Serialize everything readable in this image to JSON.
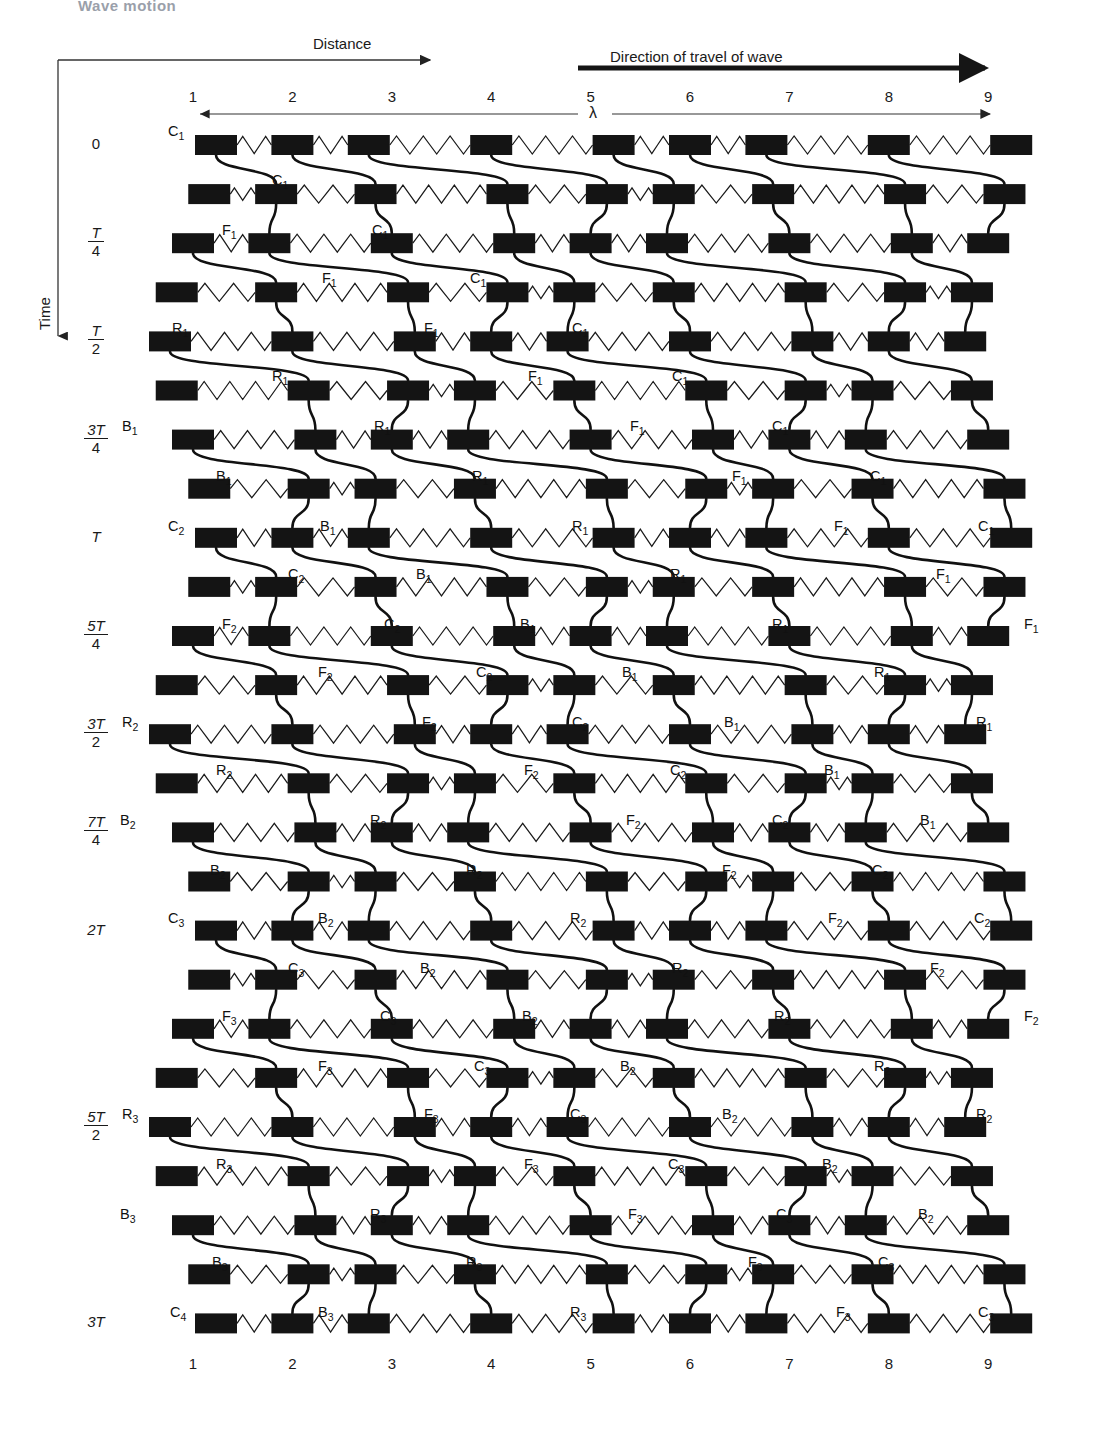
{
  "header": {
    "chapter": "Wave motion"
  },
  "axes": {
    "distance_label": "Distance",
    "direction_label": "Direction of travel of wave",
    "time_label": "Time",
    "wavelength_symbol": "λ",
    "columns": [
      "1",
      "2",
      "3",
      "4",
      "5",
      "6",
      "7",
      "8",
      "9"
    ],
    "columns_bottom": [
      "1",
      "2",
      "3",
      "4",
      "5",
      "6",
      "7",
      "8",
      "9"
    ],
    "time_ticks": [
      {
        "text": "0",
        "num": "",
        "den": "",
        "simple": true
      },
      {
        "text": "",
        "num": "T",
        "den": "4",
        "simple": false
      },
      {
        "text": "",
        "num": "T",
        "den": "2",
        "simple": false
      },
      {
        "text": "",
        "num": "3T",
        "den": "4",
        "simple": false
      },
      {
        "text": "T",
        "num": "",
        "den": "",
        "simple": true
      },
      {
        "text": "",
        "num": "5T",
        "den": "4",
        "simple": false
      },
      {
        "text": "",
        "num": "3T",
        "den": "2",
        "simple": false
      },
      {
        "text": "",
        "num": "7T",
        "den": "4",
        "simple": false
      },
      {
        "text": "2T",
        "num": "",
        "den": "",
        "simple": true
      },
      {
        "text": "",
        "num": "5T",
        "den": "2",
        "simple": false
      },
      {
        "text": "3T",
        "num": "",
        "den": "",
        "simple": true
      }
    ]
  },
  "colors": {
    "block": "#141414",
    "spring": "#1a1a1a",
    "trace": "#111111",
    "axis": "#333333",
    "background": "#ffffff"
  },
  "diagram": {
    "type": "longitudinal-wave-particle-displacement",
    "n_columns": 9,
    "n_rows": 25,
    "block_width": 42,
    "block_height": 20,
    "row_spacing": 49.1,
    "column_spacing": 99.4,
    "amplitude_px": 23,
    "first_row_y": 145,
    "first_col_x": 172,
    "phase_per_column_deg": -90,
    "phase_per_row_deg": -45
  },
  "point_labels": [
    {
      "text": "C",
      "sub": "1",
      "x": 168,
      "y": 123
    },
    {
      "text": "C",
      "sub": "1",
      "x": 272,
      "y": 172
    },
    {
      "text": "F",
      "sub": "1",
      "x": 222,
      "y": 222
    },
    {
      "text": "C",
      "sub": "1",
      "x": 372,
      "y": 222
    },
    {
      "text": "F",
      "sub": "1",
      "x": 322,
      "y": 270
    },
    {
      "text": "C",
      "sub": "1",
      "x": 470,
      "y": 270
    },
    {
      "text": "R",
      "sub": "1",
      "x": 172,
      "y": 320
    },
    {
      "text": "F",
      "sub": "1",
      "x": 424,
      "y": 320
    },
    {
      "text": "C",
      "sub": "1",
      "x": 572,
      "y": 320
    },
    {
      "text": "R",
      "sub": "1",
      "x": 272,
      "y": 368
    },
    {
      "text": "F",
      "sub": "1",
      "x": 528,
      "y": 368
    },
    {
      "text": "C",
      "sub": "1",
      "x": 672,
      "y": 368
    },
    {
      "text": "B",
      "sub": "1",
      "x": 122,
      "y": 418
    },
    {
      "text": "R",
      "sub": "1",
      "x": 374,
      "y": 418
    },
    {
      "text": "F",
      "sub": "1",
      "x": 630,
      "y": 418
    },
    {
      "text": "C",
      "sub": "1",
      "x": 772,
      "y": 418
    },
    {
      "text": "B",
      "sub": "1",
      "x": 216,
      "y": 468
    },
    {
      "text": "R",
      "sub": "1",
      "x": 472,
      "y": 468
    },
    {
      "text": "F",
      "sub": "1",
      "x": 732,
      "y": 468
    },
    {
      "text": "C",
      "sub": "1",
      "x": 870,
      "y": 468
    },
    {
      "text": "C",
      "sub": "2",
      "x": 168,
      "y": 518
    },
    {
      "text": "B",
      "sub": "1",
      "x": 320,
      "y": 518
    },
    {
      "text": "R",
      "sub": "1",
      "x": 572,
      "y": 518
    },
    {
      "text": "F",
      "sub": "1",
      "x": 834,
      "y": 518
    },
    {
      "text": "C",
      "sub": "1",
      "x": 978,
      "y": 518
    },
    {
      "text": "C",
      "sub": "2",
      "x": 288,
      "y": 566
    },
    {
      "text": "B",
      "sub": "1",
      "x": 416,
      "y": 566
    },
    {
      "text": "R",
      "sub": "1",
      "x": 670,
      "y": 566
    },
    {
      "text": "F",
      "sub": "1",
      "x": 936,
      "y": 566
    },
    {
      "text": "F",
      "sub": "2",
      "x": 222,
      "y": 616
    },
    {
      "text": "C",
      "sub": "2",
      "x": 384,
      "y": 616
    },
    {
      "text": "B",
      "sub": "1",
      "x": 520,
      "y": 616
    },
    {
      "text": "R",
      "sub": "1",
      "x": 772,
      "y": 616
    },
    {
      "text": "F",
      "sub": "1",
      "x": 1024,
      "y": 616
    },
    {
      "text": "F",
      "sub": "2",
      "x": 318,
      "y": 664
    },
    {
      "text": "C",
      "sub": "2",
      "x": 476,
      "y": 664
    },
    {
      "text": "B",
      "sub": "1",
      "x": 622,
      "y": 664
    },
    {
      "text": "R",
      "sub": "1",
      "x": 874,
      "y": 664
    },
    {
      "text": "R",
      "sub": "2",
      "x": 122,
      "y": 714
    },
    {
      "text": "F",
      "sub": "2",
      "x": 422,
      "y": 714
    },
    {
      "text": "C",
      "sub": "2",
      "x": 572,
      "y": 714
    },
    {
      "text": "B",
      "sub": "1",
      "x": 724,
      "y": 714
    },
    {
      "text": "R",
      "sub": "1",
      "x": 976,
      "y": 714
    },
    {
      "text": "R",
      "sub": "2",
      "x": 216,
      "y": 762
    },
    {
      "text": "F",
      "sub": "2",
      "x": 524,
      "y": 762
    },
    {
      "text": "C",
      "sub": "2",
      "x": 670,
      "y": 762
    },
    {
      "text": "B",
      "sub": "1",
      "x": 824,
      "y": 762
    },
    {
      "text": "B",
      "sub": "2",
      "x": 120,
      "y": 812
    },
    {
      "text": "R",
      "sub": "2",
      "x": 370,
      "y": 812
    },
    {
      "text": "F",
      "sub": "2",
      "x": 626,
      "y": 812
    },
    {
      "text": "C",
      "sub": "2",
      "x": 772,
      "y": 812
    },
    {
      "text": "B",
      "sub": "1",
      "x": 920,
      "y": 812
    },
    {
      "text": "B",
      "sub": "2",
      "x": 210,
      "y": 862
    },
    {
      "text": "R",
      "sub": "2",
      "x": 466,
      "y": 862
    },
    {
      "text": "F",
      "sub": "2",
      "x": 722,
      "y": 862
    },
    {
      "text": "C",
      "sub": "2",
      "x": 872,
      "y": 862
    },
    {
      "text": "C",
      "sub": "3",
      "x": 168,
      "y": 910
    },
    {
      "text": "B",
      "sub": "2",
      "x": 318,
      "y": 910
    },
    {
      "text": "R",
      "sub": "2",
      "x": 570,
      "y": 910
    },
    {
      "text": "F",
      "sub": "2",
      "x": 828,
      "y": 910
    },
    {
      "text": "C",
      "sub": "2",
      "x": 974,
      "y": 910
    },
    {
      "text": "C",
      "sub": "3",
      "x": 288,
      "y": 960
    },
    {
      "text": "B",
      "sub": "2",
      "x": 420,
      "y": 960
    },
    {
      "text": "R",
      "sub": "2",
      "x": 672,
      "y": 960
    },
    {
      "text": "F",
      "sub": "2",
      "x": 930,
      "y": 960
    },
    {
      "text": "F",
      "sub": "3",
      "x": 222,
      "y": 1008
    },
    {
      "text": "C",
      "sub": "3",
      "x": 380,
      "y": 1008
    },
    {
      "text": "B",
      "sub": "2",
      "x": 522,
      "y": 1008
    },
    {
      "text": "R",
      "sub": "2",
      "x": 774,
      "y": 1008
    },
    {
      "text": "F",
      "sub": "2",
      "x": 1024,
      "y": 1008
    },
    {
      "text": "F",
      "sub": "3",
      "x": 318,
      "y": 1058
    },
    {
      "text": "C",
      "sub": "3",
      "x": 474,
      "y": 1058
    },
    {
      "text": "B",
      "sub": "2",
      "x": 620,
      "y": 1058
    },
    {
      "text": "R",
      "sub": "2",
      "x": 874,
      "y": 1058
    },
    {
      "text": "R",
      "sub": "3",
      "x": 122,
      "y": 1106
    },
    {
      "text": "F",
      "sub": "3",
      "x": 424,
      "y": 1106
    },
    {
      "text": "C",
      "sub": "3",
      "x": 570,
      "y": 1106
    },
    {
      "text": "B",
      "sub": "2",
      "x": 722,
      "y": 1106
    },
    {
      "text": "R",
      "sub": "2",
      "x": 976,
      "y": 1106
    },
    {
      "text": "R",
      "sub": "3",
      "x": 216,
      "y": 1156
    },
    {
      "text": "F",
      "sub": "3",
      "x": 524,
      "y": 1156
    },
    {
      "text": "C",
      "sub": "3",
      "x": 668,
      "y": 1156
    },
    {
      "text": "B",
      "sub": "2",
      "x": 822,
      "y": 1156
    },
    {
      "text": "B",
      "sub": "3",
      "x": 120,
      "y": 1206
    },
    {
      "text": "R",
      "sub": "3",
      "x": 370,
      "y": 1206
    },
    {
      "text": "F",
      "sub": "3",
      "x": 628,
      "y": 1206
    },
    {
      "text": "C",
      "sub": "3",
      "x": 776,
      "y": 1206
    },
    {
      "text": "B",
      "sub": "2",
      "x": 918,
      "y": 1206
    },
    {
      "text": "B",
      "sub": "3",
      "x": 212,
      "y": 1254
    },
    {
      "text": "R",
      "sub": "3",
      "x": 466,
      "y": 1254
    },
    {
      "text": "F",
      "sub": "3",
      "x": 748,
      "y": 1254
    },
    {
      "text": "C",
      "sub": "3",
      "x": 878,
      "y": 1254
    },
    {
      "text": "C",
      "sub": "4",
      "x": 170,
      "y": 1304
    },
    {
      "text": "B",
      "sub": "3",
      "x": 318,
      "y": 1304
    },
    {
      "text": "R",
      "sub": "3",
      "x": 570,
      "y": 1304
    },
    {
      "text": "F",
      "sub": "3",
      "x": 836,
      "y": 1304
    },
    {
      "text": "C",
      "sub": "3",
      "x": 978,
      "y": 1304
    }
  ]
}
